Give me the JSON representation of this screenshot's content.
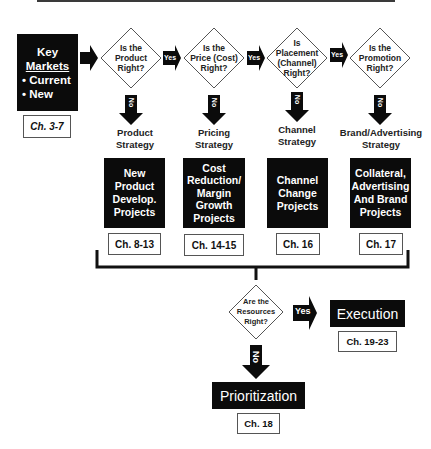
{
  "top_line": true,
  "start": {
    "title_line1": "Key",
    "title_line2": "Markets",
    "bullets": [
      "• Current",
      "• New"
    ],
    "chapter": "Ch. 3-7"
  },
  "decisions": [
    {
      "lines": [
        "Is the",
        "Product",
        "Right?"
      ]
    },
    {
      "lines": [
        "Is the",
        "Price (Cost)",
        "Right?"
      ]
    },
    {
      "lines": [
        "Is",
        "Placement",
        "(Channel)",
        "Right?"
      ]
    },
    {
      "lines": [
        "Is the",
        "Promotion",
        "Right?"
      ]
    }
  ],
  "yes_label": "Yes",
  "no_label": "No",
  "strategies": [
    {
      "lines": [
        "Product",
        "Strategy"
      ],
      "project_lines": [
        "New",
        "Product",
        "Develop.",
        "Projects"
      ],
      "chapter": "Ch. 8-13"
    },
    {
      "lines": [
        "Pricing",
        "Strategy"
      ],
      "project_lines": [
        "Cost",
        "Reduction/",
        "Margin",
        "Growth",
        "Projects"
      ],
      "chapter": "Ch. 14-15"
    },
    {
      "lines": [
        "Channel",
        "Strategy"
      ],
      "project_lines": [
        "Channel",
        "Change",
        "Projects"
      ],
      "chapter": "Ch. 16"
    },
    {
      "lines": [
        "Brand/Advertising",
        "Strategy"
      ],
      "project_lines": [
        "Collateral,",
        "Advertising",
        "And Brand",
        "Projects"
      ],
      "chapter": "Ch. 17"
    }
  ],
  "resources": {
    "lines": [
      "Are the",
      "Resources",
      "Right?"
    ],
    "yes_label": "Yes",
    "no_label": "No",
    "execution": {
      "label": "Execution",
      "chapter": "Ch. 19-23"
    },
    "prioritization": {
      "label": "Prioritization",
      "chapter": "Ch. 18"
    }
  },
  "colors": {
    "box": "#0b0b0b",
    "line": "#222222",
    "chapter_border": "#555555"
  }
}
